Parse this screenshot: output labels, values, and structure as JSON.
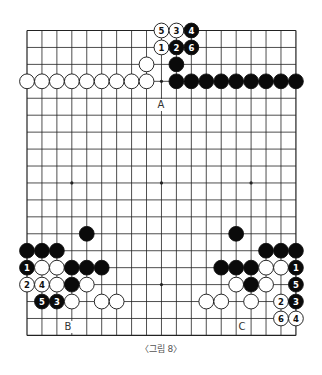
{
  "diagram": {
    "type": "go-board",
    "size": 19,
    "caption": "〈그림 8〉",
    "colors": {
      "line": "#222222",
      "black": "#0a0a0a",
      "white": "#ffffff",
      "background": "#ffffff"
    },
    "hoshi": [
      [
        3,
        3
      ],
      [
        9,
        3
      ],
      [
        15,
        3
      ],
      [
        3,
        9
      ],
      [
        9,
        9
      ],
      [
        15,
        9
      ],
      [
        3,
        15
      ],
      [
        9,
        15
      ],
      [
        15,
        15
      ]
    ],
    "stones": [
      {
        "c": "w",
        "x": 9,
        "y": 0,
        "n": "5"
      },
      {
        "c": "w",
        "x": 10,
        "y": 0,
        "n": "3"
      },
      {
        "c": "b",
        "x": 11,
        "y": 0,
        "n": "4"
      },
      {
        "c": "w",
        "x": 9,
        "y": 1,
        "n": "1"
      },
      {
        "c": "b",
        "x": 10,
        "y": 1,
        "n": "2"
      },
      {
        "c": "b",
        "x": 11,
        "y": 1,
        "n": "6"
      },
      {
        "c": "w",
        "x": 8,
        "y": 2
      },
      {
        "c": "b",
        "x": 10,
        "y": 2
      },
      {
        "c": "w",
        "x": 0,
        "y": 3
      },
      {
        "c": "w",
        "x": 1,
        "y": 3
      },
      {
        "c": "w",
        "x": 2,
        "y": 3
      },
      {
        "c": "w",
        "x": 3,
        "y": 3
      },
      {
        "c": "w",
        "x": 4,
        "y": 3
      },
      {
        "c": "w",
        "x": 5,
        "y": 3
      },
      {
        "c": "w",
        "x": 6,
        "y": 3
      },
      {
        "c": "w",
        "x": 7,
        "y": 3
      },
      {
        "c": "w",
        "x": 8,
        "y": 3
      },
      {
        "c": "b",
        "x": 10,
        "y": 3
      },
      {
        "c": "b",
        "x": 11,
        "y": 3
      },
      {
        "c": "b",
        "x": 12,
        "y": 3
      },
      {
        "c": "b",
        "x": 13,
        "y": 3
      },
      {
        "c": "b",
        "x": 14,
        "y": 3
      },
      {
        "c": "b",
        "x": 15,
        "y": 3
      },
      {
        "c": "b",
        "x": 16,
        "y": 3
      },
      {
        "c": "b",
        "x": 17,
        "y": 3
      },
      {
        "c": "b",
        "x": 18,
        "y": 3
      },
      {
        "c": "b",
        "x": 4,
        "y": 12
      },
      {
        "c": "b",
        "x": 14,
        "y": 12
      },
      {
        "c": "b",
        "x": 0,
        "y": 13
      },
      {
        "c": "b",
        "x": 1,
        "y": 13
      },
      {
        "c": "b",
        "x": 2,
        "y": 13
      },
      {
        "c": "b",
        "x": 16,
        "y": 13
      },
      {
        "c": "b",
        "x": 17,
        "y": 13
      },
      {
        "c": "b",
        "x": 18,
        "y": 13
      },
      {
        "c": "b",
        "x": 0,
        "y": 14,
        "n": "1"
      },
      {
        "c": "w",
        "x": 1,
        "y": 14
      },
      {
        "c": "w",
        "x": 2,
        "y": 14
      },
      {
        "c": "b",
        "x": 3,
        "y": 14
      },
      {
        "c": "b",
        "x": 4,
        "y": 14
      },
      {
        "c": "b",
        "x": 5,
        "y": 14
      },
      {
        "c": "b",
        "x": 13,
        "y": 14
      },
      {
        "c": "b",
        "x": 14,
        "y": 14
      },
      {
        "c": "b",
        "x": 15,
        "y": 14
      },
      {
        "c": "w",
        "x": 16,
        "y": 14
      },
      {
        "c": "w",
        "x": 17,
        "y": 14
      },
      {
        "c": "b",
        "x": 18,
        "y": 14,
        "n": "1"
      },
      {
        "c": "w",
        "x": 0,
        "y": 15,
        "n": "2"
      },
      {
        "c": "w",
        "x": 1,
        "y": 15,
        "n": "4"
      },
      {
        "c": "w",
        "x": 2,
        "y": 15
      },
      {
        "c": "b",
        "x": 3,
        "y": 15
      },
      {
        "c": "w",
        "x": 4,
        "y": 15
      },
      {
        "c": "w",
        "x": 14,
        "y": 15
      },
      {
        "c": "b",
        "x": 15,
        "y": 15
      },
      {
        "c": "w",
        "x": 16,
        "y": 15
      },
      {
        "c": "b",
        "x": 18,
        "y": 15,
        "n": "5"
      },
      {
        "c": "b",
        "x": 1,
        "y": 16,
        "n": "5"
      },
      {
        "c": "b",
        "x": 2,
        "y": 16,
        "n": "3"
      },
      {
        "c": "w",
        "x": 3,
        "y": 16
      },
      {
        "c": "w",
        "x": 5,
        "y": 16
      },
      {
        "c": "w",
        "x": 6,
        "y": 16
      },
      {
        "c": "w",
        "x": 12,
        "y": 16
      },
      {
        "c": "w",
        "x": 13,
        "y": 16
      },
      {
        "c": "w",
        "x": 15,
        "y": 16
      },
      {
        "c": "w",
        "x": 17,
        "y": 16,
        "n": "2"
      },
      {
        "c": "b",
        "x": 18,
        "y": 16,
        "n": "3"
      },
      {
        "c": "w",
        "x": 17,
        "y": 17,
        "n": "6"
      },
      {
        "c": "w",
        "x": 18,
        "y": 17,
        "n": "4"
      }
    ],
    "labels": [
      {
        "text": "A",
        "px": 161,
        "py": 108
      },
      {
        "text": "B",
        "px": 68,
        "py": 330
      },
      {
        "text": "C",
        "px": 242,
        "py": 330
      }
    ]
  }
}
